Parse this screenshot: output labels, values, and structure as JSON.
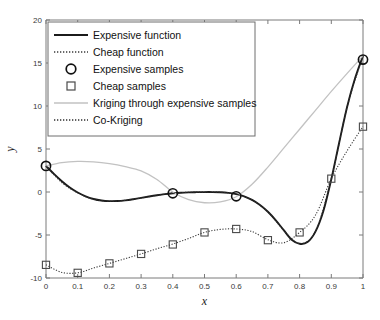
{
  "chart_data": {
    "type": "line",
    "title": "",
    "xlabel": "x",
    "ylabel": "y",
    "xlim": [
      0,
      1
    ],
    "ylim": [
      -10,
      20
    ],
    "xticks": [
      "0",
      "0.1",
      "0.2",
      "0.3",
      "0.4",
      "0.5",
      "0.6",
      "0.7",
      "0.8",
      "0.9",
      "1"
    ],
    "xtick_values": [
      0,
      0.1,
      0.2,
      0.3,
      0.4,
      0.5,
      0.6,
      0.7,
      0.8,
      0.9,
      1
    ],
    "yticks": [
      "-10",
      "-5",
      "0",
      "5",
      "10",
      "15",
      "20"
    ],
    "ytick_values": [
      -10,
      -5,
      0,
      5,
      10,
      15,
      20
    ],
    "grid": false,
    "legend_position": "upper-left",
    "legend": [
      {
        "label": "Expensive function",
        "style": "solid-line",
        "color": "#1b1b1b"
      },
      {
        "label": "Cheap function",
        "style": "dotted-line",
        "color": "#3a3a3a"
      },
      {
        "label": "Expensive samples",
        "style": "circle-marker",
        "color": "#111111"
      },
      {
        "label": "Cheap samples",
        "style": "square-marker",
        "color": "#4a4a4a"
      },
      {
        "label": "Kriging through expensive samples",
        "style": "solid-line-light",
        "color": "#c2c2c2"
      },
      {
        "label": "Co-Kriging",
        "style": "dotted-line",
        "color": "#2e2e2e"
      }
    ],
    "series": [
      {
        "name": "Expensive function",
        "style": "solid-line",
        "color": "#1b1b1b",
        "x": [
          0,
          0.025,
          0.05,
          0.075,
          0.1,
          0.125,
          0.15,
          0.175,
          0.2,
          0.225,
          0.25,
          0.275,
          0.3,
          0.325,
          0.35,
          0.375,
          0.4,
          0.425,
          0.45,
          0.475,
          0.5,
          0.525,
          0.55,
          0.575,
          0.6,
          0.625,
          0.65,
          0.675,
          0.7,
          0.725,
          0.75,
          0.775,
          0.8,
          0.825,
          0.85,
          0.875,
          0.9,
          0.925,
          0.95,
          0.975,
          1
        ],
        "values": [
          3.03,
          2.1,
          1.25,
          0.52,
          -0.06,
          -0.5,
          -0.81,
          -0.99,
          -1.06,
          -1.05,
          -0.97,
          -0.84,
          -0.69,
          -0.53,
          -0.38,
          -0.25,
          -0.15,
          -0.08,
          -0.04,
          -0.02,
          -0.01,
          -0.01,
          -0.03,
          -0.1,
          -0.25,
          -0.51,
          -0.92,
          -1.51,
          -2.3,
          -3.29,
          -4.44,
          -5.55,
          -6.02,
          -5.82,
          -4.6,
          -2.2,
          1.49,
          5.76,
          9.91,
          13.22,
          15.83
        ]
      },
      {
        "name": "Cheap function",
        "style": "dotted-line",
        "color": "#3a3a3a",
        "x": [
          0,
          0.05,
          0.1,
          0.15,
          0.2,
          0.25,
          0.3,
          0.35,
          0.4,
          0.45,
          0.5,
          0.55,
          0.6,
          0.65,
          0.7,
          0.75,
          0.8,
          0.85,
          0.9,
          0.95,
          1
        ],
        "values": [
          -8.47,
          -9.35,
          -9.4,
          -8.84,
          -8.3,
          -7.75,
          -7.2,
          -6.6,
          -6.05,
          -5.4,
          -4.7,
          -4.35,
          -4.3,
          -4.6,
          -5.55,
          -5.9,
          -4.7,
          -2.7,
          1.55,
          4.8,
          7.6
        ]
      },
      {
        "name": "Kriging through expensive samples",
        "style": "solid-line-light",
        "color": "#c2c2c2",
        "x": [
          0,
          0.05,
          0.1,
          0.15,
          0.2,
          0.25,
          0.3,
          0.35,
          0.4,
          0.45,
          0.5,
          0.55,
          0.6,
          0.65,
          0.7,
          0.75,
          0.8,
          0.85,
          0.9,
          0.95,
          1
        ],
        "values": [
          3.03,
          3.42,
          3.55,
          3.5,
          3.3,
          2.95,
          2.45,
          1.45,
          0.0,
          -0.9,
          -1.25,
          -1.15,
          -0.55,
          0.9,
          2.9,
          5.1,
          7.3,
          9.5,
          11.7,
          13.8,
          15.83
        ]
      },
      {
        "name": "Co-Kriging",
        "style": "dotted-line",
        "color": "#2e2e2e",
        "x": [
          0,
          0.05,
          0.1,
          0.15,
          0.2,
          0.25,
          0.3,
          0.35,
          0.4,
          0.45,
          0.5,
          0.55,
          0.6,
          0.65,
          0.7,
          0.75,
          0.8,
          0.85,
          0.9,
          0.95,
          1
        ],
        "values": [
          3.03,
          1.1,
          -0.1,
          -0.85,
          -1.08,
          -0.97,
          -0.7,
          -0.38,
          -0.13,
          -0.03,
          -0.01,
          -0.03,
          -0.25,
          -0.95,
          -2.3,
          -4.45,
          -6.0,
          -4.55,
          1.5,
          9.9,
          15.83
        ]
      }
    ],
    "expensive_samples": {
      "name": "Expensive samples",
      "marker": "circle",
      "x": [
        0,
        0.4,
        0.6,
        1
      ],
      "values": [
        3.03,
        -0.15,
        -0.5,
        15.4
      ]
    },
    "cheap_samples": {
      "name": "Cheap samples",
      "marker": "square",
      "x": [
        0,
        0.1,
        0.2,
        0.3,
        0.4,
        0.5,
        0.6,
        0.7,
        0.8,
        0.9,
        1
      ],
      "values": [
        -8.47,
        -9.4,
        -8.3,
        -7.2,
        -6.1,
        -4.7,
        -4.3,
        -5.6,
        -4.7,
        1.55,
        7.6
      ]
    }
  }
}
